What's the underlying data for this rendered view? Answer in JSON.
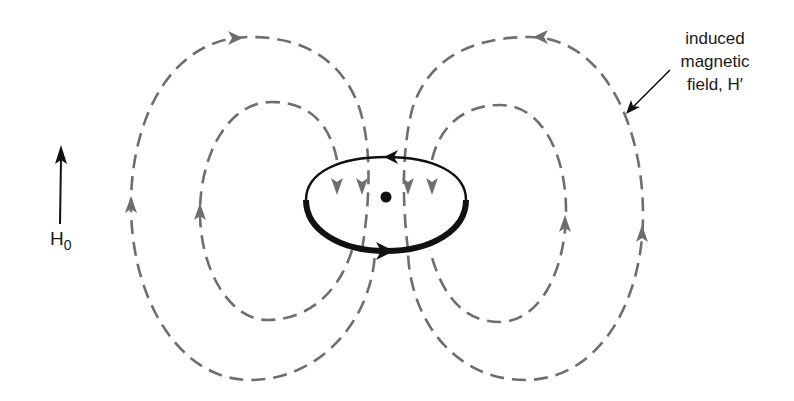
{
  "diagram": {
    "labels": {
      "induced_line1": "induced",
      "induced_line2": "magnetic",
      "induced_line3": "field, H′",
      "applied_field": "H",
      "applied_field_sub": "0"
    },
    "elements": [
      {
        "name": "applied-field-arrow",
        "direction": "up"
      },
      {
        "name": "ring-current",
        "shape": "ellipse",
        "circulation": "counter-clockwise (top arrow left, bottom arrow right)"
      },
      {
        "name": "nucleus-dot"
      },
      {
        "name": "field-loop-outer-left",
        "style": "dashed",
        "direction": "up on outside, down through ring"
      },
      {
        "name": "field-loop-inner-left",
        "style": "dashed",
        "direction": "up on outside, down through ring"
      },
      {
        "name": "field-loop-outer-right",
        "style": "dashed",
        "direction": "up on outside, down through ring"
      },
      {
        "name": "field-loop-inner-right",
        "style": "dashed",
        "direction": "up on outside, down through ring"
      }
    ],
    "colors": {
      "field_lines": "#6e6e6e",
      "ring": "#111111",
      "text": "#1a1a1a"
    }
  }
}
